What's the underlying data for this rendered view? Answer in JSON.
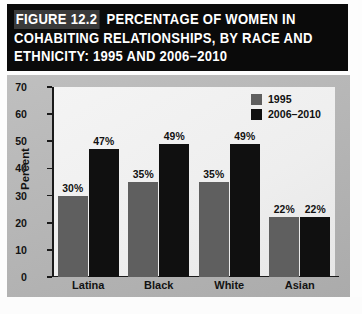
{
  "figure": {
    "number_label": "FIGURE 12.2",
    "title_line_1": "PERCENTAGE OF WOMEN IN",
    "title_line_2": "COHABITING RELATIONSHIPS, BY RACE AND",
    "title_line_3": "ETHNICITY: 1995 AND 2006–2010"
  },
  "colors": {
    "title_band": "#0a0a0a",
    "figure_number_box": "#3a3a3a",
    "chart_background": "#b4b4b4",
    "plot_background": "#f0f0f0",
    "series_1995": "#5f5f5f",
    "series_2006_2010": "#101010",
    "axis": "#1a1a1a",
    "text": "#111111"
  },
  "chart_data": {
    "type": "bar",
    "xlabel": "",
    "ylabel": "Percent",
    "ylim": [
      0,
      70
    ],
    "ytick_labels": [
      "70",
      "60",
      "50",
      "40",
      "30",
      "20",
      "10",
      "0"
    ],
    "ytick_values": [
      70,
      60,
      50,
      40,
      30,
      20,
      10,
      0
    ],
    "grid": false,
    "legend_position": "top-right",
    "categories": [
      "Latina",
      "Black",
      "White",
      "Asian"
    ],
    "series": [
      {
        "name": "1995",
        "color": "#5f5f5f",
        "values": [
          30,
          35,
          35,
          22
        ],
        "data_labels": [
          "30%",
          "35%",
          "35%",
          "22%"
        ]
      },
      {
        "name": "2006–2010",
        "color": "#101010",
        "values": [
          47,
          49,
          49,
          22
        ],
        "data_labels": [
          "47%",
          "49%",
          "49%",
          "22%"
        ]
      }
    ]
  }
}
